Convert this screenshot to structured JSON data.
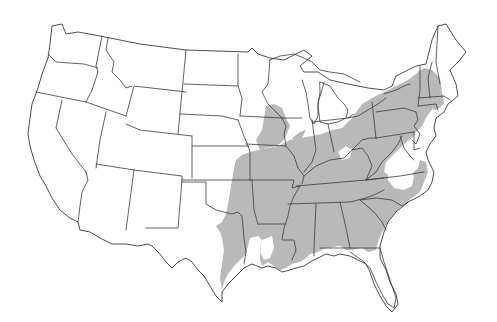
{
  "map": {
    "type": "choropleth-range",
    "region": "Contiguous United States",
    "background_color": "#ffffff",
    "border_color": "#3a3a3a",
    "range_color": "#b9b9b9",
    "legend": null,
    "title": null,
    "shaded_range": {
      "description": "Eastern United States distribution range",
      "states_fully_or_mostly_shaded": [
        "Missouri",
        "Arkansas",
        "Louisiana",
        "Mississippi",
        "Alabama",
        "Tennessee",
        "Kentucky",
        "Georgia",
        "South Carolina",
        "West Virginia",
        "Pennsylvania"
      ],
      "states_partially_shaded": [
        "Texas",
        "Oklahoma",
        "Kansas",
        "Iowa",
        "Illinois",
        "Indiana",
        "Ohio",
        "Virginia",
        "North Carolina",
        "Maryland",
        "New Jersey",
        "New York",
        "Vermont",
        "New Hampshire",
        "Massachusetts",
        "Connecticut",
        "Florida"
      ],
      "unshaded_gaps": [
        "Central North Carolina/southern Virginia piedmont",
        "Southern Louisiana coast",
        "Northern Kentucky/southern Ohio patch"
      ]
    }
  }
}
